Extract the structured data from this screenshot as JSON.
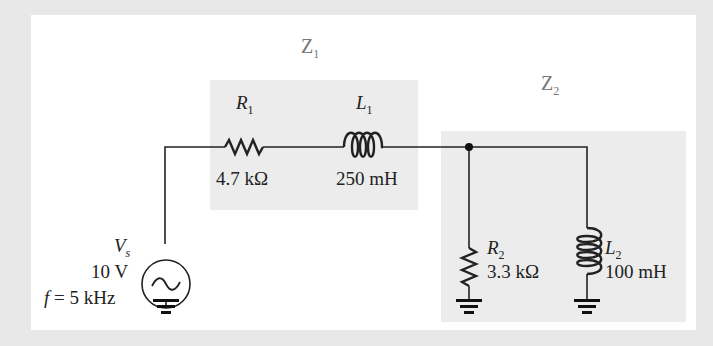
{
  "diagram": {
    "zones": [
      {
        "id": "Z1",
        "label": "Z",
        "sub": "1"
      },
      {
        "id": "Z2",
        "label": "Z",
        "sub": "2"
      }
    ],
    "source": {
      "name": "V",
      "sub": "s",
      "voltage": "10 V",
      "frequency": "f = 5 kHz",
      "f_symbol": "f",
      "f_value": " = 5 kHz"
    },
    "components": {
      "R1": {
        "name": "R",
        "sub": "1",
        "value": "4.7 kΩ"
      },
      "L1": {
        "name": "L",
        "sub": "1",
        "value": "250 mH"
      },
      "R2": {
        "name": "R",
        "sub": "2",
        "value": "3.3 kΩ"
      },
      "L2": {
        "name": "L",
        "sub": "2",
        "value": "100 mH"
      }
    },
    "colors": {
      "background": "#e8e8e8",
      "panel": "#ffffff",
      "zone_shade": "#ececec",
      "wire": "#222222",
      "zone_label": "#777777"
    }
  }
}
